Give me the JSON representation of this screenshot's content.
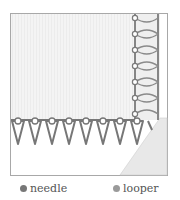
{
  "diagram": {
    "colors": {
      "frame": "#a8a8a8",
      "fabric": "#f3f3f3",
      "fabric_stripe": "#ececec",
      "fold": "#e6e6e6",
      "needle_thread": "#777777",
      "looper_thread": "#8f8f8f"
    }
  },
  "legend": {
    "items": [
      {
        "label": "needle",
        "color": "#777777"
      },
      {
        "label": "looper",
        "color": "#9a9a9a"
      }
    ]
  }
}
